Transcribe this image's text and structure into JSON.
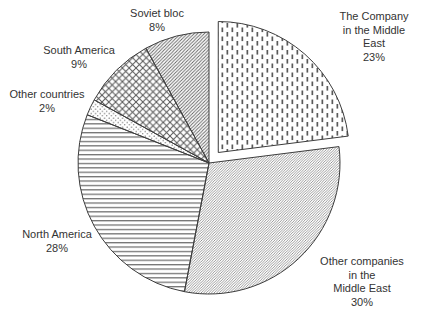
{
  "chart_data": {
    "type": "pie",
    "unit": "%",
    "start_angle_deg": 0,
    "direction": "clockwise",
    "background_color": "#ffffff",
    "ink_color": "#3d3d3d",
    "legend_position": "labels-around-pie",
    "slices": [
      {
        "id": "company-middle-east",
        "label": "The Company in the Middle East",
        "value": 23,
        "pattern": "vdash",
        "exploded": true
      },
      {
        "id": "other-companies-middle-east",
        "label": "Other companies in the Middle East",
        "value": 30,
        "pattern": "fine-diag",
        "exploded": false
      },
      {
        "id": "north-america",
        "label": "North America",
        "value": 28,
        "pattern": "hlines",
        "exploded": false
      },
      {
        "id": "other-countries",
        "label": "Other countries",
        "value": 2,
        "pattern": "dots",
        "exploded": false
      },
      {
        "id": "south-america",
        "label": "South America",
        "value": 9,
        "pattern": "cross",
        "exploded": false
      },
      {
        "id": "soviet-bloc",
        "label": "Soviet bloc",
        "value": 8,
        "pattern": "diag",
        "exploded": false
      }
    ],
    "labels": [
      {
        "id": "soviet-bloc",
        "text": "Soviet bloc\n8%"
      },
      {
        "id": "company-middle-east",
        "text": "The Company in the Middle\nEast\n23%"
      },
      {
        "id": "south-america",
        "text": "South America\n9%"
      },
      {
        "id": "other-countries",
        "text": "Other countries\n2%"
      },
      {
        "id": "north-america",
        "text": "North America\n28%"
      },
      {
        "id": "other-companies-middle-east",
        "text": "Other companies in the\nMiddle East\n30%"
      }
    ]
  }
}
